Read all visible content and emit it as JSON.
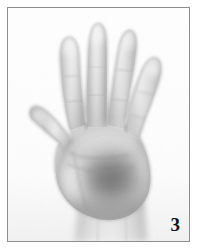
{
  "figure": {
    "number_label": "3",
    "caption_text": "",
    "media_type": "grayscale photograph",
    "frame_color": "#8d8d8d",
    "plate_background": "#fdfdfd",
    "page_background": "#ffffff",
    "label_color": "#131313"
  },
  "image_content": {
    "alt_text": "Grayscale photograph of an open left hand with the palm facing the camera, fingers spread apart, thumb extended to the left, wrist visible at the bottom edge.",
    "tones": {
      "highlight": "#f4f4f4",
      "skin_light": "#d9d9d9",
      "skin_mid": "#b4b4b4",
      "skin_shadow": "#949494",
      "palm_core_shadow": "#767676",
      "deep_shadow": "#5f5f5f",
      "outline": "#8a8a8a"
    },
    "anatomy": [
      {
        "name": "thumb",
        "position": "left",
        "tip_x": 24,
        "tip_y": 112
      },
      {
        "name": "index-finger",
        "position": "left-center",
        "tip_x": 62,
        "tip_y": 32
      },
      {
        "name": "middle-finger",
        "position": "center",
        "tip_x": 92,
        "tip_y": 17
      },
      {
        "name": "ring-finger",
        "position": "right-center",
        "tip_x": 127,
        "tip_y": 24
      },
      {
        "name": "little-finger",
        "position": "right",
        "tip_x": 155,
        "tip_y": 54
      },
      {
        "name": "palm",
        "position": "center",
        "center_x": 100,
        "center_y": 160
      },
      {
        "name": "wrist",
        "position": "bottom-center",
        "center_x": 103,
        "center_y": 232
      }
    ]
  }
}
